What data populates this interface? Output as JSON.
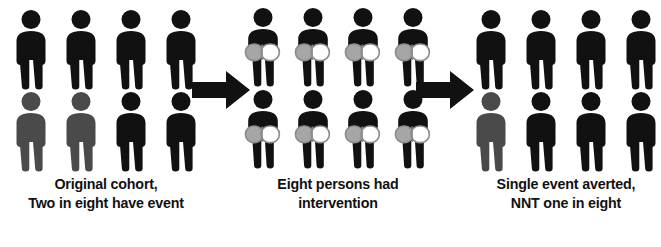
{
  "figure": {
    "background_color": "#ffffff",
    "colors": {
      "person_event": "#4a4a4a",
      "person_no_event": "#111111",
      "arrow": "#111111",
      "capsule_left": "#a6a6a6",
      "capsule_right": "#ffffff",
      "capsule_outline": "#8c8c8c",
      "caption_text": "#111111"
    },
    "panels": [
      {
        "id": "original-cohort",
        "caption_lines": [
          "Original cohort,",
          "Two in eight have event"
        ],
        "total_people": 8,
        "event_count": 2,
        "intervention_count": 0,
        "people": [
          {
            "state": "no-event",
            "has_capsule": false
          },
          {
            "state": "no-event",
            "has_capsule": false
          },
          {
            "state": "no-event",
            "has_capsule": false
          },
          {
            "state": "no-event",
            "has_capsule": false
          },
          {
            "state": "event",
            "has_capsule": false
          },
          {
            "state": "event",
            "has_capsule": false
          },
          {
            "state": "no-event",
            "has_capsule": false
          },
          {
            "state": "no-event",
            "has_capsule": false
          }
        ]
      },
      {
        "id": "intervention",
        "caption_lines": [
          "Eight persons had",
          "intervention"
        ],
        "total_people": 8,
        "event_count": 0,
        "intervention_count": 8,
        "people": [
          {
            "state": "no-event",
            "has_capsule": true
          },
          {
            "state": "no-event",
            "has_capsule": true
          },
          {
            "state": "no-event",
            "has_capsule": true
          },
          {
            "state": "no-event",
            "has_capsule": true
          },
          {
            "state": "no-event",
            "has_capsule": true
          },
          {
            "state": "no-event",
            "has_capsule": true
          },
          {
            "state": "no-event",
            "has_capsule": true
          },
          {
            "state": "no-event",
            "has_capsule": true
          }
        ]
      },
      {
        "id": "outcome",
        "caption_lines": [
          "Single event averted,",
          "NNT one in eight"
        ],
        "total_people": 8,
        "event_count": 1,
        "intervention_count": 0,
        "people": [
          {
            "state": "no-event",
            "has_capsule": false
          },
          {
            "state": "no-event",
            "has_capsule": false
          },
          {
            "state": "no-event",
            "has_capsule": false
          },
          {
            "state": "no-event",
            "has_capsule": false
          },
          {
            "state": "event",
            "has_capsule": false
          },
          {
            "state": "no-event",
            "has_capsule": false
          },
          {
            "state": "no-event",
            "has_capsule": false
          },
          {
            "state": "no-event",
            "has_capsule": false
          }
        ]
      }
    ],
    "arrows": [
      {
        "id": "arrow-1",
        "direction": "right"
      },
      {
        "id": "arrow-2",
        "direction": "right"
      }
    ]
  }
}
